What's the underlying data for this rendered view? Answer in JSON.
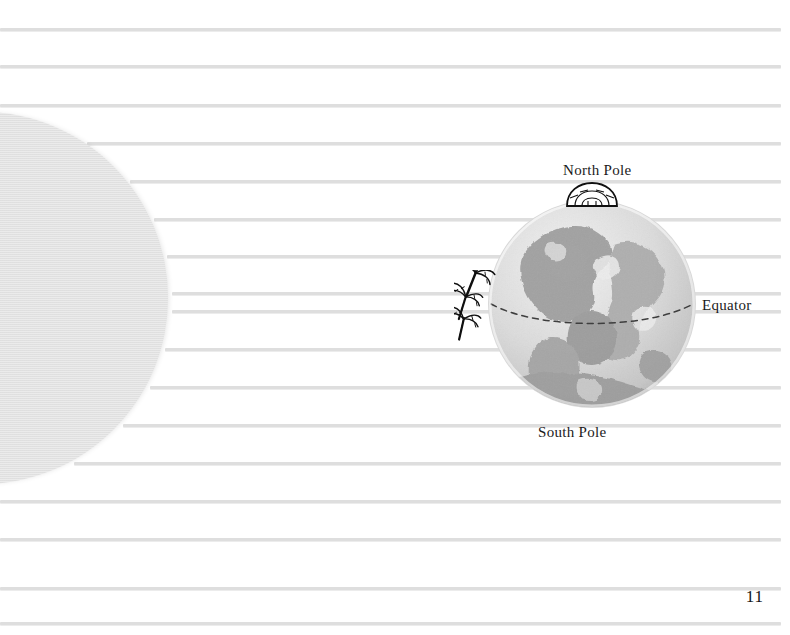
{
  "page": {
    "kind": "notebook-page",
    "page_number": "11",
    "background_color": "#ffffff",
    "rule_color": "#dedede",
    "ink_color": "#1b1b1b",
    "disc_color": "#e2e2e2",
    "width": 790,
    "height": 635
  },
  "ruled_lines": {
    "count": 17,
    "color": "#dedede",
    "thickness_px": 3,
    "right_edge_x": 781,
    "y_positions": [
      28,
      65,
      104,
      142,
      180,
      218,
      255,
      292,
      310,
      348,
      386,
      424,
      462,
      500,
      538,
      587,
      622
    ]
  },
  "page_disc": {
    "name": "facing-page-disc",
    "center_x": -18,
    "center_y": 298,
    "radius": 186,
    "color": "#e2e2e2"
  },
  "illustration": {
    "name": "earth-globe-diagram",
    "globe": {
      "center_x": 592,
      "center_y": 304,
      "radius": 104,
      "ocean_color": "#d9d9d9",
      "land_color": "#a8a8a8",
      "highlight_color": "#efefef"
    },
    "equator_line": {
      "style": "dashed",
      "color": "#3a3a3a"
    },
    "igloo": {
      "name": "igloo-icon",
      "location": "north-pole",
      "color": "#101010"
    },
    "palm_trees": {
      "name": "palm-tree-icon",
      "count": 3,
      "location": "equator-west",
      "color": "#101010"
    }
  },
  "labels": {
    "north_pole": "North Pole",
    "south_pole": "South Pole",
    "equator": "Equator"
  }
}
